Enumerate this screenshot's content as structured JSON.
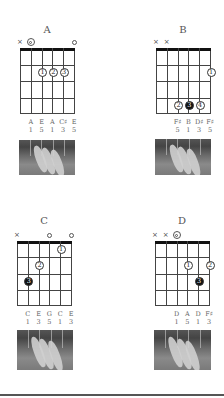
{
  "chords": [
    {
      "name": "A",
      "muted": [
        0
      ],
      "open": [
        5
      ],
      "root_open": [
        1
      ],
      "fingers": [
        {
          "string": 2,
          "fret": 2,
          "label": "1",
          "filled": false
        },
        {
          "string": 3,
          "fret": 2,
          "label": "2",
          "filled": false
        },
        {
          "string": 4,
          "fret": 2,
          "label": "3",
          "filled": false
        }
      ],
      "notes": [
        {
          "string": 1,
          "note": "A",
          "degree": "1"
        },
        {
          "string": 2,
          "note": "E",
          "degree": "5"
        },
        {
          "string": 3,
          "note": "A",
          "degree": "1"
        },
        {
          "string": 4,
          "note": "C♯",
          "degree": "3"
        },
        {
          "string": 5,
          "note": "E",
          "degree": "5"
        }
      ]
    },
    {
      "name": "B",
      "muted": [
        0,
        1
      ],
      "open": [],
      "root_open": [],
      "fingers": [
        {
          "string": 5,
          "fret": 2,
          "label": "1",
          "filled": false
        },
        {
          "string": 2,
          "fret": 4,
          "label": "2",
          "filled": false
        },
        {
          "string": 3,
          "fret": 4,
          "label": "3",
          "filled": true
        },
        {
          "string": 4,
          "fret": 4,
          "label": "4",
          "filled": false
        }
      ],
      "notes": [
        {
          "string": 2,
          "note": "F♯",
          "degree": "5"
        },
        {
          "string": 3,
          "note": "B",
          "degree": "1"
        },
        {
          "string": 4,
          "note": "D♯",
          "degree": "3"
        },
        {
          "string": 5,
          "note": "F♯",
          "degree": "5"
        }
      ]
    },
    {
      "name": "C",
      "muted": [
        0
      ],
      "open": [
        3,
        5
      ],
      "root_open": [],
      "fingers": [
        {
          "string": 4,
          "fret": 1,
          "label": "1",
          "filled": false
        },
        {
          "string": 2,
          "fret": 2,
          "label": "2",
          "filled": false
        },
        {
          "string": 1,
          "fret": 3,
          "label": "3",
          "filled": true
        }
      ],
      "notes": [
        {
          "string": 1,
          "note": "C",
          "degree": "1"
        },
        {
          "string": 2,
          "note": "E",
          "degree": "3"
        },
        {
          "string": 3,
          "note": "G",
          "degree": "5"
        },
        {
          "string": 4,
          "note": "C",
          "degree": "1"
        },
        {
          "string": 5,
          "note": "E",
          "degree": "3"
        }
      ]
    },
    {
      "name": "D",
      "muted": [
        0,
        1
      ],
      "open": [],
      "root_open": [
        2
      ],
      "fingers": [
        {
          "string": 3,
          "fret": 2,
          "label": "1",
          "filled": false
        },
        {
          "string": 5,
          "fret": 2,
          "label": "2",
          "filled": false
        },
        {
          "string": 4,
          "fret": 3,
          "label": "3",
          "filled": true
        }
      ],
      "notes": [
        {
          "string": 2,
          "note": "D",
          "degree": "1"
        },
        {
          "string": 3,
          "note": "A",
          "degree": "5"
        },
        {
          "string": 4,
          "note": "D",
          "degree": "1"
        },
        {
          "string": 5,
          "note": "F♯",
          "degree": "3"
        }
      ]
    }
  ],
  "symbols": {
    "muted": "×"
  }
}
